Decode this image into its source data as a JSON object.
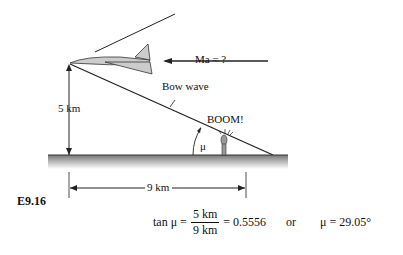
{
  "figure": {
    "label": "E9.16",
    "speed_label": "Ma = ?",
    "wave_label": "Bow wave",
    "height_label": "5 km",
    "distance_label": "9 km",
    "sound_label": "BOOM!",
    "angle_symbol": "μ"
  },
  "equation": {
    "lhs": "tan μ =",
    "numerator": "5 km",
    "denominator": "9 km",
    "result": "= 0.5556",
    "or": "or",
    "final": "μ = 29.05°"
  }
}
